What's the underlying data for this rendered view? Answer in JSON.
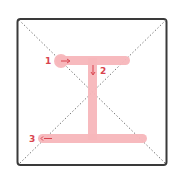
{
  "diagram": {
    "colors": {
      "frame": "#3a3a3a",
      "diagonal": "#7a7a7a",
      "stroke_fill": "#f7b6bb",
      "label": "#d9434e"
    },
    "strokes": [
      {
        "number": "1",
        "direction": "right",
        "arrow": "→"
      },
      {
        "number": "2",
        "direction": "down",
        "arrow": "↓"
      },
      {
        "number": "3",
        "direction": "right",
        "arrow": "→"
      }
    ]
  }
}
